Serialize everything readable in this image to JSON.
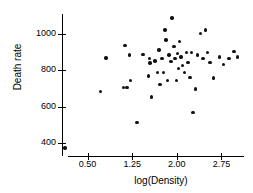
{
  "chart_data": {
    "type": "scatter",
    "title": "",
    "xlabel": "log(Density)",
    "ylabel": "Death rate",
    "xlim": [
      0.07,
      3.18
    ],
    "ylim": [
      330,
      1110
    ],
    "xticks": [
      0.5,
      1.25,
      2.0,
      2.75
    ],
    "xticklabels": [
      "0.50",
      "1.25",
      "2.00",
      "2.75"
    ],
    "yticks": [
      400,
      600,
      800,
      1000
    ],
    "yticklabels": [
      "400",
      "600",
      "800",
      "1000"
    ],
    "grid": false,
    "legend": null,
    "marker": "filled-circle",
    "marker_color": "#111111",
    "points": [
      {
        "x": 0.12,
        "y": 375
      },
      {
        "x": 0.72,
        "y": 683
      },
      {
        "x": 0.81,
        "y": 868
      },
      {
        "x": 1.1,
        "y": 705
      },
      {
        "x": 1.13,
        "y": 938
      },
      {
        "x": 1.16,
        "y": 705
      },
      {
        "x": 1.2,
        "y": 884
      },
      {
        "x": 1.22,
        "y": 745
      },
      {
        "x": 1.33,
        "y": 515
      },
      {
        "x": 1.43,
        "y": 889
      },
      {
        "x": 1.52,
        "y": 770
      },
      {
        "x": 1.54,
        "y": 866
      },
      {
        "x": 1.55,
        "y": 841
      },
      {
        "x": 1.57,
        "y": 654
      },
      {
        "x": 1.63,
        "y": 852
      },
      {
        "x": 1.68,
        "y": 788
      },
      {
        "x": 1.7,
        "y": 912
      },
      {
        "x": 1.72,
        "y": 722
      },
      {
        "x": 1.75,
        "y": 866
      },
      {
        "x": 1.78,
        "y": 790
      },
      {
        "x": 1.8,
        "y": 1022
      },
      {
        "x": 1.82,
        "y": 968
      },
      {
        "x": 1.84,
        "y": 744
      },
      {
        "x": 1.87,
        "y": 884
      },
      {
        "x": 1.9,
        "y": 848
      },
      {
        "x": 1.92,
        "y": 1089
      },
      {
        "x": 1.95,
        "y": 930
      },
      {
        "x": 1.97,
        "y": 866
      },
      {
        "x": 1.99,
        "y": 745
      },
      {
        "x": 2.01,
        "y": 893
      },
      {
        "x": 2.03,
        "y": 812
      },
      {
        "x": 2.05,
        "y": 958
      },
      {
        "x": 2.07,
        "y": 873
      },
      {
        "x": 2.1,
        "y": 826
      },
      {
        "x": 2.13,
        "y": 788
      },
      {
        "x": 2.16,
        "y": 900
      },
      {
        "x": 2.19,
        "y": 843
      },
      {
        "x": 2.22,
        "y": 762
      },
      {
        "x": 2.25,
        "y": 900
      },
      {
        "x": 2.27,
        "y": 570
      },
      {
        "x": 2.31,
        "y": 699
      },
      {
        "x": 2.35,
        "y": 884
      },
      {
        "x": 2.4,
        "y": 1002
      },
      {
        "x": 2.44,
        "y": 866
      },
      {
        "x": 2.48,
        "y": 1022
      },
      {
        "x": 2.52,
        "y": 900
      },
      {
        "x": 2.56,
        "y": 843
      },
      {
        "x": 2.62,
        "y": 758
      },
      {
        "x": 2.72,
        "y": 873
      },
      {
        "x": 2.78,
        "y": 834
      },
      {
        "x": 2.88,
        "y": 866
      },
      {
        "x": 2.96,
        "y": 905
      },
      {
        "x": 3.02,
        "y": 873
      }
    ]
  }
}
